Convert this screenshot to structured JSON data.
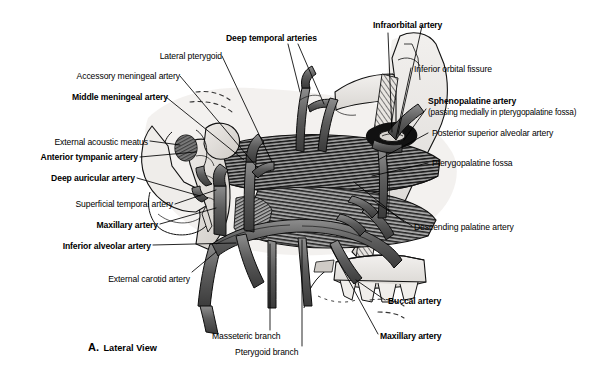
{
  "figure": {
    "caption_letter": "A.",
    "caption_text": "Lateral View",
    "view": "Lateral View",
    "background_color": "#ffffff",
    "ink_color": "#000000"
  },
  "labels": {
    "left": [
      {
        "id": "lateral-pterygoid",
        "text": "Lateral pterygoid",
        "bold": false
      },
      {
        "id": "accessory-meningeal-artery",
        "text": "Accessory meningeal artery",
        "bold": false
      },
      {
        "id": "middle-meningeal-artery",
        "text": "Middle meningeal artery",
        "bold": true
      },
      {
        "id": "external-acoustic-meatus",
        "text": "External acoustic meatus",
        "bold": false
      },
      {
        "id": "anterior-tympanic-artery",
        "text": "Anterior tympanic artery",
        "bold": true
      },
      {
        "id": "deep-auricular-artery",
        "text": "Deep auricular artery",
        "bold": true
      },
      {
        "id": "superficial-temporal-artery",
        "text": "Superficial temporal artery",
        "bold": false
      },
      {
        "id": "maxillary-artery-left",
        "text": "Maxillary artery",
        "bold": true
      },
      {
        "id": "inferior-alveolar-artery",
        "text": "Inferior alveolar artery",
        "bold": true
      },
      {
        "id": "external-carotid-artery",
        "text": "External carotid artery",
        "bold": false
      }
    ],
    "top": [
      {
        "id": "deep-temporal-arteries",
        "text": "Deep temporal arteries",
        "bold": true
      },
      {
        "id": "infraorbital-artery",
        "text": "Infraorbital artery",
        "bold": true
      }
    ],
    "right": [
      {
        "id": "inferior-orbital-fissure",
        "text": "Inferior orbital fissure",
        "bold": false
      },
      {
        "id": "sphenopalatine-artery",
        "text": "Sphenopalatine artery",
        "bold": true
      },
      {
        "id": "sphenopalatine-artery-note",
        "text": "(passing medially in pterygopalatine fossa)",
        "bold": false
      },
      {
        "id": "posterior-superior-alveolar-artery",
        "text": "Posterior superior alveolar artery",
        "bold": false
      },
      {
        "id": "pterygopalatine-fossa",
        "text": "Pterygopalatine fossa",
        "bold": false
      },
      {
        "id": "descending-palatine-artery",
        "text": "Descending palatine artery",
        "bold": false
      },
      {
        "id": "buccal-artery",
        "text": "Buccal artery",
        "bold": true
      },
      {
        "id": "maxillary-artery-right",
        "text": "Maxillary artery",
        "bold": true
      }
    ],
    "bottom": [
      {
        "id": "masseteric-branch",
        "text": "Masseteric branch",
        "bold": false
      },
      {
        "id": "pterygoid-branch",
        "text": "Pterygoid branch",
        "bold": false
      }
    ]
  }
}
